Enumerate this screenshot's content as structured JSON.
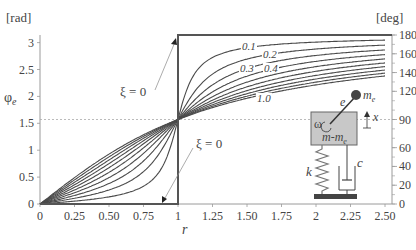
{
  "chart_data": {
    "type": "line",
    "title": "",
    "xlabel": "r",
    "ylabel": "φe",
    "ylabel_left_unit": "[rad]",
    "ylabel_right_unit": "[deg]",
    "xlim": [
      0,
      2.5
    ],
    "ylim": [
      0,
      3.14159
    ],
    "x_ticks": [
      "0",
      "0.25",
      "0.50",
      "0.75",
      "1",
      "1.25",
      "1.50",
      "1.75",
      "2",
      "2.25",
      "2.50"
    ],
    "x_tick_values": [
      0,
      0.25,
      0.5,
      0.75,
      1,
      1.25,
      1.5,
      1.75,
      2,
      2.25,
      2.5
    ],
    "y_ticks_left": [
      "0",
      "0.5",
      "1",
      "1.5",
      "2",
      "2.5",
      "3"
    ],
    "y_tick_values_left": [
      0,
      0.5,
      1,
      1.5,
      2,
      2.5,
      3
    ],
    "y_ticks_right": [
      "0",
      "20",
      "40",
      "60",
      "90",
      "120",
      "140",
      "160",
      "180"
    ],
    "y_tick_values_right_deg": [
      0,
      20,
      40,
      60,
      90,
      120,
      140,
      160,
      180
    ],
    "grid": false,
    "reference_line": {
      "y": 1.5708,
      "style": "dashed",
      "label": "π/2"
    },
    "formula": "phi = atan2(2*xi*r, 1 - r^2)",
    "series": [
      {
        "name": "ξ = 0",
        "xi": 0,
        "description": "step: 0 for r<1, π for r>1"
      },
      {
        "name": "0.1",
        "xi": 0.1
      },
      {
        "name": "0.2",
        "xi": 0.2
      },
      {
        "name": "0.3",
        "xi": 0.3
      },
      {
        "name": "0.4",
        "xi": 0.4
      },
      {
        "name": "0.5",
        "xi": 0.5
      },
      {
        "name": "0.6",
        "xi": 0.6
      },
      {
        "name": "0.7",
        "xi": 0.7
      },
      {
        "name": "0.8",
        "xi": 0.8
      },
      {
        "name": "0.9",
        "xi": 0.9
      },
      {
        "name": "1.0",
        "xi": 1.0
      }
    ],
    "curve_labels": [
      "0.1",
      "0.2",
      "0.3",
      "0.4",
      "1.0"
    ],
    "annotations": [
      {
        "text": "ξ = 0",
        "position": "upper-left of r=1",
        "arrow_to": "top of step"
      },
      {
        "text": "ξ = 0",
        "position": "lower-right of r=1",
        "arrow_to": "bottom of step"
      }
    ],
    "inset_diagram": {
      "description": "rotating unbalance mass-spring-damper",
      "labels": {
        "mass": "m-me",
        "eccentric_mass": "me",
        "eccentricity": "e",
        "omega": "ω",
        "spring": "k",
        "damper": "c",
        "displacement": "x"
      }
    }
  },
  "labels": {
    "left_unit": "[rad]",
    "right_unit": "[deg]",
    "y_axis": "φ",
    "y_axis_sub": "e",
    "x_axis": "r",
    "xi_zero_upper": "ξ = 0",
    "xi_zero_lower": "ξ = 0",
    "curve_01": "0.1",
    "curve_02": "0.2",
    "curve_03": "0.3",
    "curve_04": "0.4",
    "curve_10": "1.0",
    "diagram_mass": "m-m",
    "diagram_mass_sub": "e",
    "diagram_me": "m",
    "diagram_me_sub": "e",
    "diagram_e": "e",
    "diagram_omega": "ω",
    "diagram_k": "k",
    "diagram_c": "c",
    "diagram_x": "x"
  },
  "colors": {
    "curve": "#4a4a4a",
    "axis": "#999999",
    "frame": "#555555",
    "dashed": "#aaaaaa",
    "mass_fill": "#c8c8c8",
    "base_fill": "#444444"
  }
}
